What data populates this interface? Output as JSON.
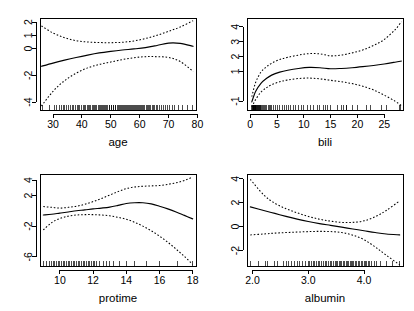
{
  "figure": {
    "title": "",
    "layout": "2x2 grid of smoothed partial effect plots",
    "background_color": "#ffffff",
    "line_color": "#000000"
  },
  "chart_data": [
    {
      "type": "line",
      "panel": "top-left",
      "title": "",
      "xlabel": "age",
      "ylabel": "",
      "xlim": [
        25.5,
        79.5
      ],
      "ylim": [
        -4.6,
        2.3
      ],
      "xticks": [
        30,
        40,
        50,
        60,
        70,
        80
      ],
      "yticks": [
        -4,
        -2,
        0,
        1,
        2
      ],
      "grid": false,
      "legend": "none",
      "series": [
        {
          "name": "fit",
          "style": "solid",
          "x": [
            26,
            30,
            34,
            38,
            42,
            46,
            50,
            54,
            58,
            62,
            66,
            70,
            74,
            78.5
          ],
          "values": [
            -1.32,
            -1.08,
            -0.86,
            -0.66,
            -0.48,
            -0.32,
            -0.2,
            -0.1,
            -0.02,
            0.08,
            0.24,
            0.42,
            0.4,
            0.18
          ]
        },
        {
          "name": "upper-ci",
          "style": "dashed",
          "x": [
            26,
            30,
            34,
            38,
            42,
            46,
            50,
            54,
            58,
            62,
            66,
            70,
            74,
            78.5
          ],
          "values": [
            1.7,
            1.18,
            0.82,
            0.6,
            0.5,
            0.46,
            0.45,
            0.48,
            0.58,
            0.76,
            1.0,
            1.3,
            1.62,
            2.1
          ]
        },
        {
          "name": "lower-ci",
          "style": "dashed",
          "x": [
            26,
            30,
            34,
            38,
            42,
            46,
            50,
            54,
            58,
            62,
            66,
            70,
            74,
            78.5
          ],
          "values": [
            -4.3,
            -3.2,
            -2.4,
            -1.84,
            -1.44,
            -1.18,
            -1.0,
            -0.82,
            -0.68,
            -0.6,
            -0.6,
            -0.66,
            -0.96,
            -1.7
          ]
        }
      ],
      "rug": {
        "present": true,
        "position": "bottom",
        "x": [
          26.3,
          28.9,
          30.6,
          31.3,
          32.1,
          33.0,
          33.7,
          34.0,
          34.8,
          35.4,
          36.1,
          36.8,
          37.2,
          37.9,
          38.4,
          38.9,
          39.3,
          39.9,
          40.4,
          40.9,
          41.3,
          41.8,
          42.2,
          42.7,
          43.1,
          43.5,
          44.0,
          44.4,
          44.8,
          45.2,
          45.6,
          46.0,
          46.4,
          46.8,
          47.2,
          47.5,
          47.9,
          48.3,
          48.6,
          49.0,
          49.4,
          49.7,
          50.1,
          50.4,
          50.8,
          51.1,
          51.5,
          51.8,
          52.2,
          52.5,
          52.9,
          53.2,
          53.6,
          53.9,
          54.3,
          54.6,
          55.0,
          55.3,
          55.7,
          56.0,
          56.4,
          56.7,
          57.1,
          57.4,
          57.8,
          58.1,
          58.5,
          58.8,
          59.2,
          59.5,
          59.9,
          60.3,
          60.6,
          61.0,
          61.4,
          61.8,
          62.2,
          62.6,
          63.0,
          63.4,
          63.9,
          64.3,
          64.8,
          65.3,
          65.8,
          66.3,
          66.9,
          67.5,
          68.1,
          68.8,
          69.5,
          70.3,
          71.2,
          72.2,
          73.4,
          74.8,
          76.5,
          78.4
        ]
      }
    },
    {
      "type": "line",
      "panel": "top-right",
      "title": "",
      "xlabel": "bili",
      "ylabel": "",
      "xlim": [
        -0.6,
        28.5
      ],
      "ylim": [
        -1.6,
        4.6
      ],
      "xticks": [
        0,
        5,
        10,
        15,
        20,
        25
      ],
      "yticks": [
        -1,
        1,
        2,
        3,
        4
      ],
      "grid": false,
      "legend": "none",
      "series": [
        {
          "name": "fit",
          "style": "solid",
          "x": [
            0.3,
            1.0,
            2.0,
            3.0,
            4.0,
            5.5,
            7.0,
            9.0,
            11.0,
            13.0,
            15.0,
            17.0,
            19.0,
            21.0,
            23.0,
            25.0,
            27.0,
            28.2
          ],
          "values": [
            -1.05,
            -0.35,
            0.2,
            0.52,
            0.75,
            0.95,
            1.08,
            1.2,
            1.27,
            1.25,
            1.18,
            1.2,
            1.25,
            1.32,
            1.4,
            1.5,
            1.62,
            1.7
          ]
        },
        {
          "name": "upper-ci",
          "style": "dashed",
          "x": [
            0.3,
            1.0,
            2.0,
            3.0,
            4.0,
            5.5,
            7.0,
            9.0,
            11.0,
            13.0,
            15.0,
            17.0,
            19.0,
            21.0,
            23.0,
            25.0,
            27.0,
            28.2
          ],
          "values": [
            -0.7,
            0.25,
            0.95,
            1.3,
            1.55,
            1.8,
            1.95,
            2.1,
            2.2,
            2.18,
            2.05,
            2.1,
            2.25,
            2.45,
            2.75,
            3.15,
            3.8,
            4.35
          ]
        },
        {
          "name": "lower-ci",
          "style": "dashed",
          "x": [
            0.3,
            1.0,
            2.0,
            3.0,
            4.0,
            5.5,
            7.0,
            9.0,
            11.0,
            13.0,
            15.0,
            17.0,
            19.0,
            21.0,
            23.0,
            25.0,
            27.0,
            28.2
          ],
          "values": [
            -1.4,
            -0.9,
            -0.4,
            -0.1,
            0.1,
            0.3,
            0.42,
            0.52,
            0.55,
            0.5,
            0.4,
            0.3,
            0.18,
            0.0,
            -0.25,
            -0.6,
            -1.0,
            -1.3
          ]
        }
      ],
      "rug": {
        "present": true,
        "position": "bottom",
        "x": [
          0.3,
          0.4,
          0.5,
          0.55,
          0.6,
          0.65,
          0.7,
          0.75,
          0.8,
          0.85,
          0.9,
          0.95,
          1.0,
          1.05,
          1.1,
          1.2,
          1.3,
          1.4,
          1.5,
          1.6,
          1.7,
          1.8,
          1.9,
          2.0,
          2.1,
          2.3,
          2.5,
          2.7,
          2.9,
          3.1,
          3.4,
          3.6,
          3.8,
          4.0,
          4.4,
          4.7,
          5.0,
          5.5,
          6.0,
          6.4,
          6.8,
          7.1,
          7.5,
          8.0,
          8.4,
          9.0,
          9.5,
          10.0,
          10.6,
          11.2,
          11.8,
          12.6,
          13.0,
          13.6,
          14.1,
          14.4,
          15.0,
          16.2,
          17.1,
          17.4,
          17.9,
          18.0,
          19.0,
          20.0,
          21.6,
          22.5,
          24.5,
          25.5,
          27.8,
          28.0
        ]
      }
    },
    {
      "type": "line",
      "panel": "bottom-left",
      "title": "",
      "xlabel": "protime",
      "ylabel": "",
      "xlim": [
        8.8,
        18.2
      ],
      "ylim": [
        -7.2,
        4.8
      ],
      "xticks": [
        10,
        12,
        14,
        16,
        18
      ],
      "yticks": [
        -6,
        -2,
        2,
        4
      ],
      "grid": false,
      "legend": "none",
      "series": [
        {
          "name": "fit",
          "style": "solid",
          "x": [
            9.0,
            9.5,
            10.0,
            10.5,
            11.0,
            11.5,
            12.0,
            12.5,
            13.0,
            13.5,
            14.0,
            14.5,
            15.0,
            15.5,
            16.0,
            16.5,
            17.0,
            17.5,
            18.0
          ],
          "values": [
            -0.55,
            -0.45,
            -0.3,
            -0.15,
            0.0,
            0.12,
            0.25,
            0.35,
            0.48,
            0.7,
            0.95,
            1.05,
            1.05,
            0.9,
            0.6,
            0.25,
            -0.15,
            -0.6,
            -1.05
          ]
        },
        {
          "name": "upper-ci",
          "style": "dashed",
          "x": [
            9.0,
            9.5,
            10.0,
            10.5,
            11.0,
            11.5,
            12.0,
            12.5,
            13.0,
            13.5,
            14.0,
            14.5,
            15.0,
            15.5,
            16.0,
            16.5,
            17.0,
            17.5,
            18.0
          ],
          "values": [
            0.55,
            0.45,
            0.35,
            0.45,
            0.6,
            0.85,
            1.2,
            1.6,
            2.05,
            2.5,
            2.9,
            3.1,
            3.2,
            3.25,
            3.3,
            3.45,
            3.65,
            3.95,
            4.4
          ]
        },
        {
          "name": "lower-ci",
          "style": "dashed",
          "x": [
            9.0,
            9.5,
            10.0,
            10.5,
            11.0,
            11.5,
            12.0,
            12.5,
            13.0,
            13.5,
            14.0,
            14.5,
            15.0,
            15.5,
            16.0,
            16.5,
            17.0,
            17.5,
            18.0
          ],
          "values": [
            -2.5,
            -1.55,
            -1.0,
            -0.7,
            -0.55,
            -0.5,
            -0.5,
            -0.55,
            -0.65,
            -0.85,
            -1.1,
            -1.5,
            -2.0,
            -2.6,
            -3.3,
            -4.1,
            -5.0,
            -5.95,
            -7.0
          ]
        }
      ],
      "rug": {
        "present": true,
        "position": "bottom",
        "x": [
          9.0,
          9.2,
          9.4,
          9.5,
          9.6,
          9.7,
          9.8,
          9.9,
          10.0,
          10.1,
          10.2,
          10.3,
          10.4,
          10.5,
          10.6,
          10.7,
          10.8,
          10.9,
          11.0,
          11.1,
          11.2,
          11.3,
          11.4,
          11.5,
          11.6,
          11.7,
          11.8,
          11.9,
          12.0,
          12.1,
          12.2,
          12.4,
          12.6,
          12.8,
          13.0,
          13.2,
          13.6,
          14.0,
          14.5,
          15.2,
          16.0,
          17.1,
          18.0
        ]
      }
    },
    {
      "type": "line",
      "panel": "bottom-right",
      "title": "",
      "xlabel": "albumin",
      "ylabel": "",
      "xlim": [
        1.9,
        4.7
      ],
      "ylim": [
        -3.3,
        4.4
      ],
      "xticks": [
        2.0,
        3.0,
        4.0
      ],
      "xtick_labels": [
        "2.0",
        "3.0",
        "4.0"
      ],
      "yticks": [
        -2,
        0,
        2,
        4
      ],
      "grid": false,
      "legend": "none",
      "series": [
        {
          "name": "fit",
          "style": "solid",
          "x": [
            1.96,
            2.2,
            2.4,
            2.6,
            2.8,
            3.0,
            3.2,
            3.4,
            3.6,
            3.8,
            4.0,
            4.2,
            4.4,
            4.64
          ],
          "values": [
            1.65,
            1.35,
            1.1,
            0.85,
            0.62,
            0.42,
            0.25,
            0.1,
            -0.05,
            -0.2,
            -0.35,
            -0.5,
            -0.62,
            -0.7
          ]
        },
        {
          "name": "upper-ci",
          "style": "dashed",
          "x": [
            1.96,
            2.2,
            2.4,
            2.6,
            2.8,
            3.0,
            3.2,
            3.4,
            3.6,
            3.8,
            4.0,
            4.2,
            4.4,
            4.64
          ],
          "values": [
            3.95,
            2.65,
            1.95,
            1.5,
            1.15,
            0.85,
            0.62,
            0.45,
            0.35,
            0.35,
            0.48,
            0.82,
            1.35,
            2.15
          ]
        },
        {
          "name": "lower-ci",
          "style": "dashed",
          "x": [
            1.96,
            2.2,
            2.4,
            2.6,
            2.8,
            3.0,
            3.2,
            3.4,
            3.6,
            3.8,
            4.0,
            4.2,
            4.4,
            4.64
          ],
          "values": [
            -0.7,
            -0.62,
            -0.55,
            -0.5,
            -0.46,
            -0.42,
            -0.4,
            -0.42,
            -0.5,
            -0.72,
            -1.1,
            -1.7,
            -2.4,
            -3.2
          ]
        }
      ],
      "rug": {
        "present": true,
        "position": "bottom",
        "x": [
          1.96,
          2.1,
          2.23,
          2.27,
          2.4,
          2.45,
          2.55,
          2.6,
          2.65,
          2.7,
          2.75,
          2.8,
          2.85,
          2.9,
          2.95,
          3.0,
          3.03,
          3.06,
          3.09,
          3.12,
          3.15,
          3.18,
          3.21,
          3.24,
          3.27,
          3.3,
          3.33,
          3.36,
          3.39,
          3.42,
          3.45,
          3.48,
          3.5,
          3.53,
          3.56,
          3.58,
          3.6,
          3.63,
          3.65,
          3.68,
          3.7,
          3.72,
          3.75,
          3.77,
          3.8,
          3.82,
          3.85,
          3.87,
          3.9,
          3.92,
          3.95,
          3.97,
          4.0,
          4.02,
          4.05,
          4.08,
          4.1,
          4.14,
          4.18,
          4.22,
          4.3,
          4.4,
          4.52,
          4.64
        ]
      }
    }
  ]
}
